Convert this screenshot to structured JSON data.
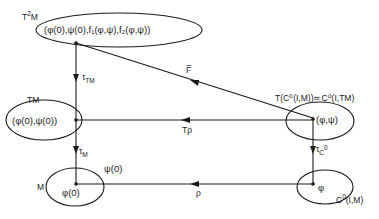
{
  "diagram": {
    "type": "commutative-diagram",
    "colors": {
      "ink": "#1a1a1a",
      "background": "#ffffff"
    },
    "nodes": {
      "t2m": {
        "space_label": "T",
        "space_sup": "2",
        "space_tail": "M",
        "content": "(φ(0),ψ(0),f₁(φ,ψ),f₂(φ,ψ))"
      },
      "tm": {
        "space_label": "TM",
        "content": "(φ(0),ψ(0))"
      },
      "m": {
        "space_label": "M",
        "content": "φ(0)",
        "annotation": "ψ(0)"
      },
      "tc": {
        "space_label": "T(C⁰(I,M))≃C⁰(I,TM)",
        "content": "(φ,ψ)"
      },
      "c": {
        "space_label_main": "C",
        "space_label_sup": "0",
        "space_label_tail": "(I,M)",
        "content": "φ"
      }
    },
    "arrows": {
      "tau_tm": {
        "label": "τ",
        "sub": "TM",
        "from": "t2m",
        "to": "tm"
      },
      "tau_m": {
        "label": "τ",
        "sub": "M",
        "from": "tm",
        "to": "m"
      },
      "fbar": {
        "label": "F̅",
        "from": "tc",
        "to": "t2m"
      },
      "t_rho": {
        "label": "Tρ",
        "from": "tc",
        "to": "tm"
      },
      "tau_c0": {
        "label": "τ",
        "sub": "C",
        "sup": "0",
        "from": "tc",
        "to": "c"
      },
      "rho": {
        "label": "ρ",
        "from": "c",
        "to": "m"
      }
    }
  }
}
